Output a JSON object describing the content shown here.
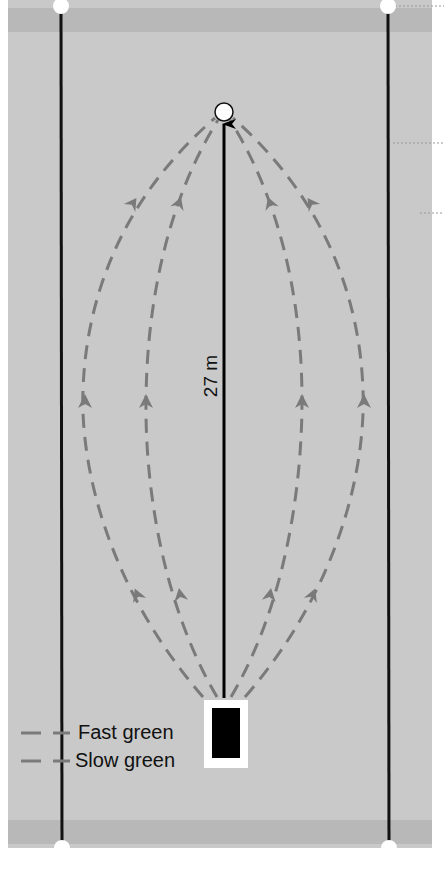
{
  "diagram": {
    "distance_label": "27 m",
    "legend": [
      {
        "label": "Fast green",
        "line_style": "dashed",
        "color": "#7a7a7a"
      },
      {
        "label": "Slow green",
        "line_style": "dashed",
        "color": "#7a7a7a"
      }
    ],
    "colors": {
      "green_surface": "#c9c9c9",
      "edge_band": "#b9b9b9",
      "boundary_line": "#111111",
      "path_dash": "#7a7a7a",
      "target": "#ffffff",
      "mat_outer": "#ffffff",
      "mat_inner": "#000000"
    },
    "elements": {
      "target_marker": "white circle at far end",
      "start_marker": "white mat with black block",
      "arrow": "straight arrow from start to target",
      "boundary_posts": 4
    }
  }
}
